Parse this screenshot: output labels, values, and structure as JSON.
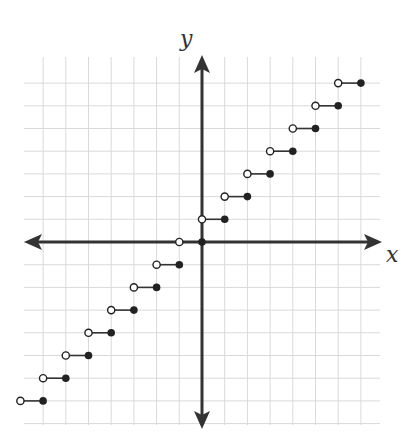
{
  "chart_data": {
    "type": "line",
    "title": "",
    "function": "y = ceil(x) (step function)",
    "xlabel": "x",
    "ylabel": "y",
    "xlim": [
      -8,
      8
    ],
    "ylim": [
      -8,
      7
    ],
    "grid": true,
    "ticks_labeled": false,
    "steps": [
      {
        "y": -7,
        "x_open": -8,
        "x_closed": -7
      },
      {
        "y": -6,
        "x_open": -7,
        "x_closed": -6
      },
      {
        "y": -5,
        "x_open": -6,
        "x_closed": -5
      },
      {
        "y": -4,
        "x_open": -5,
        "x_closed": -4
      },
      {
        "y": -3,
        "x_open": -4,
        "x_closed": -3
      },
      {
        "y": -2,
        "x_open": -3,
        "x_closed": -2
      },
      {
        "y": -1,
        "x_open": -2,
        "x_closed": -1
      },
      {
        "y": 0,
        "x_open": -1,
        "x_closed": 0
      },
      {
        "y": 1,
        "x_open": 0,
        "x_closed": 1
      },
      {
        "y": 2,
        "x_open": 1,
        "x_closed": 2
      },
      {
        "y": 3,
        "x_open": 2,
        "x_closed": 3
      },
      {
        "y": 4,
        "x_open": 3,
        "x_closed": 4
      },
      {
        "y": 5,
        "x_open": 4,
        "x_closed": 5
      },
      {
        "y": 6,
        "x_open": 5,
        "x_closed": 6
      },
      {
        "y": 7,
        "x_open": 6,
        "x_closed": 7
      }
    ],
    "legend": "open circle = excluded endpoint, filled circle = included endpoint"
  },
  "labels": {
    "x_axis": "x",
    "y_axis": "y"
  },
  "colors": {
    "grid": "#d9d9d9",
    "axis": "#333333",
    "dot": "#222222",
    "open_fill": "#ffffff",
    "step": "#333333"
  },
  "layout": {
    "origin_px": [
      202,
      242
    ],
    "unit_px": 22.7,
    "grid_left": 24,
    "grid_right": 380,
    "grid_top": 57,
    "grid_bottom": 425
  }
}
